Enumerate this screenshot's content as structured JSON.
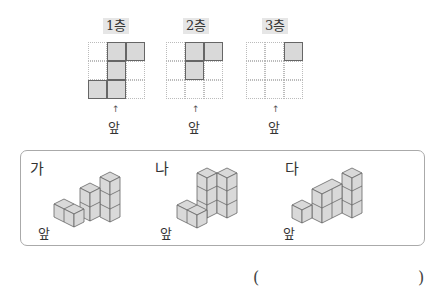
{
  "layer_maps": [
    {
      "label": "1층",
      "filled": [
        [
          0,
          1
        ],
        [
          0,
          2
        ],
        [
          1,
          1
        ],
        [
          2,
          0
        ],
        [
          2,
          1
        ]
      ],
      "front_label": "앞",
      "arrow": "↑"
    },
    {
      "label": "2층",
      "filled": [
        [
          0,
          1
        ],
        [
          0,
          2
        ],
        [
          1,
          1
        ]
      ],
      "front_label": "앞",
      "arrow": "↑"
    },
    {
      "label": "3층",
      "filled": [
        [
          0,
          2
        ]
      ],
      "front_label": "앞",
      "arrow": "↑"
    }
  ],
  "figures": [
    {
      "label": "가",
      "front_label": "앞"
    },
    {
      "label": "나",
      "front_label": "앞"
    },
    {
      "label": "다",
      "front_label": "앞"
    }
  ],
  "answer": {
    "open": "(",
    "close": ")",
    "value": ""
  },
  "colors": {
    "cube_fill": "#d9d9d9",
    "cube_edge": "#666666",
    "grid_line": "#bbbbbb",
    "box_border": "#aaaaaa"
  }
}
